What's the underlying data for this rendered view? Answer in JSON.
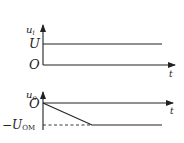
{
  "diagram": {
    "top_plot": {
      "y_axis_label": "u",
      "y_axis_sub": "i",
      "level_label": "U",
      "origin_label": "O",
      "x_axis_label": "t"
    },
    "bottom_plot": {
      "y_axis_label": "u",
      "y_axis_sub": "o",
      "origin_label": "O",
      "x_axis_label": "t",
      "level_label_prefix": "−U",
      "level_label_sub": "OM"
    },
    "colors": {
      "line": "#222222",
      "background": "#ffffff"
    }
  }
}
